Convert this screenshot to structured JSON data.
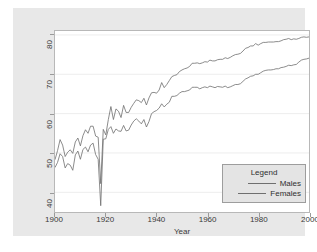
{
  "chart_data": {
    "type": "line",
    "title": "",
    "xlabel": "Year",
    "ylabel": "",
    "xlim": [
      1900,
      2000
    ],
    "ylim": [
      35,
      81
    ],
    "xticks": [
      1900,
      1920,
      1940,
      1960,
      1980,
      2000
    ],
    "yticks": [
      40,
      50,
      60,
      70,
      80
    ],
    "grid": "horizontal-faint",
    "legend": {
      "title": "Legend",
      "position": "lower-right",
      "entries": [
        "Males",
        "Females"
      ]
    },
    "x": [
      1900,
      1901,
      1902,
      1903,
      1904,
      1905,
      1906,
      1907,
      1908,
      1909,
      1910,
      1911,
      1912,
      1913,
      1914,
      1915,
      1916,
      1917,
      1918,
      1919,
      1920,
      1921,
      1922,
      1923,
      1924,
      1925,
      1926,
      1927,
      1928,
      1929,
      1930,
      1931,
      1932,
      1933,
      1934,
      1935,
      1936,
      1937,
      1938,
      1939,
      1940,
      1941,
      1942,
      1943,
      1944,
      1945,
      1946,
      1947,
      1948,
      1949,
      1950,
      1951,
      1952,
      1953,
      1954,
      1955,
      1956,
      1957,
      1958,
      1959,
      1960,
      1961,
      1962,
      1963,
      1964,
      1965,
      1966,
      1967,
      1968,
      1969,
      1970,
      1971,
      1972,
      1973,
      1974,
      1975,
      1976,
      1977,
      1978,
      1979,
      1980,
      1981,
      1982,
      1983,
      1984,
      1985,
      1986,
      1987,
      1988,
      1989,
      1990,
      1991,
      1992,
      1993,
      1994,
      1995,
      1996,
      1997,
      1998,
      1999,
      2000
    ],
    "series": [
      {
        "name": "Males",
        "color": "#6f6f6f",
        "values": [
          46.3,
          47.6,
          49.8,
          49.1,
          46.2,
          47.3,
          46.9,
          45.6,
          49.5,
          50.5,
          48.4,
          50.9,
          51.5,
          50.3,
          52.0,
          52.5,
          49.6,
          48.4,
          36.6,
          53.5,
          53.6,
          56.0,
          56.7,
          55.0,
          56.1,
          55.6,
          55.5,
          57.0,
          55.6,
          55.8,
          57.1,
          58.1,
          58.7,
          58.1,
          57.4,
          58.5,
          56.6,
          58.0,
          60.0,
          60.5,
          60.8,
          61.4,
          62.5,
          61.7,
          62.4,
          62.9,
          64.4,
          64.4,
          64.6,
          65.2,
          65.6,
          65.6,
          65.8,
          66.0,
          66.7,
          66.7,
          66.7,
          66.3,
          66.6,
          66.8,
          66.6,
          67.0,
          66.8,
          66.6,
          66.9,
          66.8,
          66.7,
          67.0,
          66.6,
          66.8,
          67.1,
          67.4,
          67.4,
          67.6,
          68.2,
          68.8,
          69.1,
          69.5,
          69.6,
          70.0,
          70.0,
          70.4,
          70.8,
          71.0,
          71.1,
          71.1,
          71.2,
          71.4,
          71.4,
          71.7,
          71.8,
          72.0,
          72.3,
          72.2,
          72.4,
          72.5,
          73.1,
          73.6,
          73.8,
          73.9,
          74.1
        ]
      },
      {
        "name": "Females",
        "color": "#6f6f6f",
        "values": [
          48.3,
          50.6,
          53.4,
          52.0,
          49.1,
          50.2,
          50.8,
          49.9,
          52.8,
          53.8,
          51.8,
          54.4,
          55.9,
          55.0,
          56.8,
          56.8,
          54.3,
          54.0,
          42.2,
          56.0,
          54.6,
          58.5,
          61.8,
          58.5,
          61.2,
          60.6,
          59.0,
          62.1,
          60.3,
          60.3,
          61.6,
          62.6,
          63.5,
          63.3,
          62.8,
          63.9,
          62.2,
          64.0,
          65.3,
          65.4,
          65.2,
          66.0,
          67.9,
          66.6,
          67.4,
          68.4,
          69.4,
          69.7,
          69.9,
          70.7,
          71.1,
          71.4,
          71.6,
          72.0,
          72.8,
          72.8,
          72.9,
          72.7,
          72.9,
          73.2,
          73.1,
          73.6,
          73.4,
          73.4,
          73.7,
          73.8,
          73.8,
          74.2,
          74.0,
          74.3,
          74.7,
          75.0,
          75.1,
          75.3,
          75.9,
          76.6,
          76.8,
          77.2,
          77.2,
          77.8,
          77.4,
          77.8,
          78.1,
          78.1,
          78.2,
          78.2,
          78.2,
          78.3,
          78.3,
          78.5,
          78.8,
          78.9,
          79.1,
          78.8,
          79.0,
          78.9,
          79.1,
          79.4,
          79.5,
          79.4,
          79.5
        ]
      }
    ]
  },
  "axis": {
    "x_title": "Year",
    "x_labels": [
      "1900",
      "1920",
      "1940",
      "1960",
      "1980",
      "2000"
    ],
    "y_labels": [
      "40",
      "50",
      "60",
      "70",
      "80"
    ]
  },
  "legend": {
    "title": "Legend",
    "males_label": "Males",
    "females_label": "Females"
  },
  "colors": {
    "background": "#e8e8e8",
    "plot_background": "#ffffff",
    "line": "#6f6f6f",
    "grid": "#ededed",
    "axis_text": "#3a3a3a"
  }
}
